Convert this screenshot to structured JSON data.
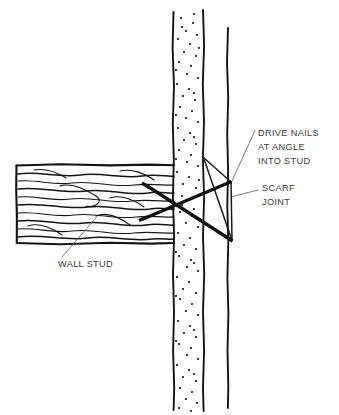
{
  "diagram": {
    "background_color": "#ffffff",
    "ink_color": "#141414",
    "label_color": "#3a3a3a",
    "leader_color": "#6a6a6a",
    "width": 339,
    "height": 415
  },
  "labels": {
    "drive_nails": {
      "line1": "DRIVE NAILS",
      "line2": "AT ANGLE",
      "line3": "INTO STUD"
    },
    "scarf_joint": {
      "line1": "SCARF",
      "line2": "JOINT"
    },
    "wall_stud": {
      "line1": "WALL STUD"
    }
  },
  "parts": {
    "stud": {
      "name": "wall stud",
      "hatch": "stipple",
      "orientation": "vertical"
    },
    "board": {
      "name": "horizontal board",
      "hatch": "wood-grain",
      "orientation": "horizontal"
    },
    "nails": {
      "name": "toe nails",
      "count": 2,
      "arrangement": "crossed-x"
    },
    "joint": {
      "name": "scarf joint",
      "shape": "triangle"
    }
  }
}
